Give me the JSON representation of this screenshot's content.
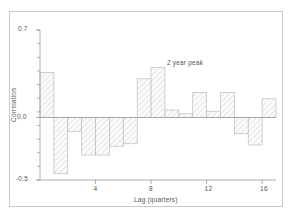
{
  "chart_data": {
    "type": "bar",
    "title": "",
    "subtitle": "",
    "xlabel": "Lag (quarters)",
    "ylabel": "Correlation",
    "xlim": [
      0,
      17
    ],
    "ylim": [
      -0.5,
      0.7
    ],
    "grid": false,
    "legend": null,
    "x_ticks": [
      4,
      8,
      12,
      16
    ],
    "x_tick_labels": [
      "4",
      "8",
      "12",
      "16"
    ],
    "y_ticks": [
      -0.5,
      0.0,
      0.7
    ],
    "y_tick_labels": [
      "-0.5",
      "0.0",
      "0.7"
    ],
    "y_minor_tick_count": 11,
    "categories": [
      1,
      2,
      3,
      4,
      5,
      6,
      7,
      8,
      9,
      10,
      11,
      12,
      13,
      14,
      15,
      16,
      17
    ],
    "values": [
      0.36,
      -0.45,
      -0.11,
      -0.3,
      -0.3,
      -0.23,
      -0.21,
      0.31,
      0.4,
      0.06,
      0.03,
      0.2,
      0.05,
      0.2,
      -0.13,
      -0.22,
      0.15
    ],
    "bar_fill": "#f2f2f2",
    "bar_hatch": "///",
    "bar_edge_color": "#bcbcbc",
    "axis_color": "#9a9a9a",
    "text_color": "#555555",
    "annotations": [
      {
        "text": "2 year peak",
        "x": 9,
        "y": 0.44
      }
    ]
  },
  "figure": {
    "frame_color": "#c9c9c9",
    "background": "#ffffff"
  }
}
